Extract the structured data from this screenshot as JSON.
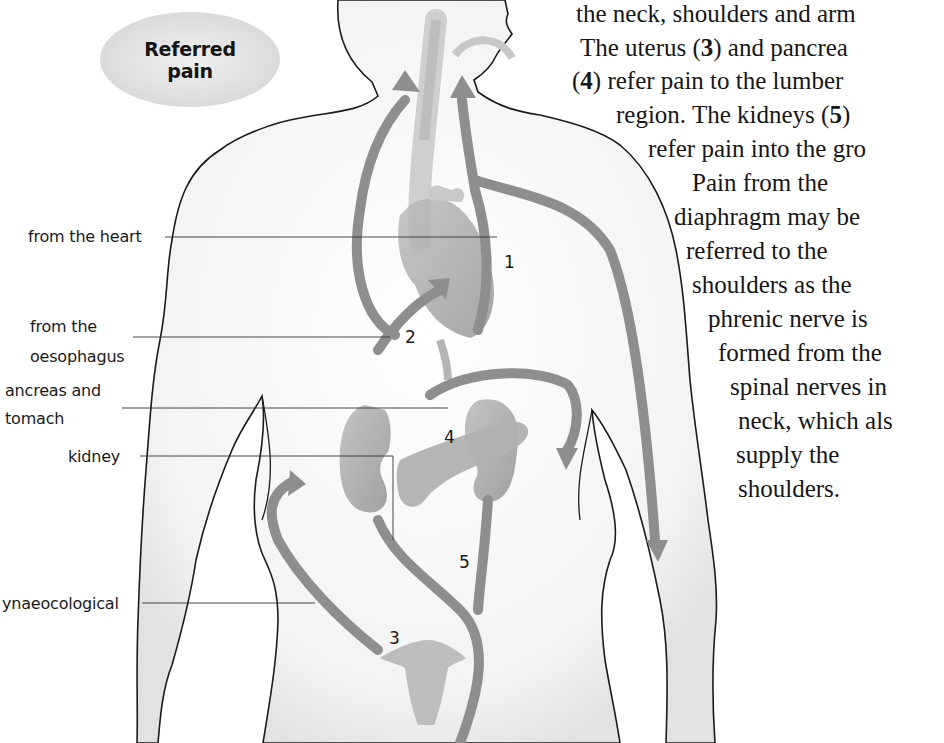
{
  "badge": {
    "line1": "Referred",
    "line2": "pain"
  },
  "labels": {
    "heart": "from the heart",
    "oesophagus_line1": "from the",
    "oesophagus_line2": "oesophagus",
    "pancreas_line1": "ancreas and",
    "pancreas_line2": "tomach",
    "kidney": "kidney",
    "gynaecological": "ynaeocological"
  },
  "numbers": {
    "n1": "1",
    "n2": "2",
    "n3": "3",
    "n4": "4",
    "n5": "5"
  },
  "prose": {
    "l1": "the neck, shoulders and arm",
    "l2a": "The uterus (",
    "l2b": "3",
    "l2c": ") and pancrea",
    "l3a": "(",
    "l3b": "4",
    "l3c": ") refer pain to the lumber",
    "l4a": "region. The kidneys (",
    "l4b": "5",
    "l4c": ")",
    "l5": "refer pain into the gro",
    "l6": "Pain from the",
    "l7": "diaphragm may be",
    "l8": "referred to the",
    "l9": "shoulders as the",
    "l10": "phrenic nerve is",
    "l11": "formed from the",
    "l12": "spinal nerves in",
    "l13": "neck, which als",
    "l14": "supply the",
    "l15": "shoulders."
  },
  "colors": {
    "arrow": "#8e8e8e",
    "organ": "#a8a8a8",
    "outline": "#1a1a1a",
    "badge": "#dcdcdc"
  }
}
